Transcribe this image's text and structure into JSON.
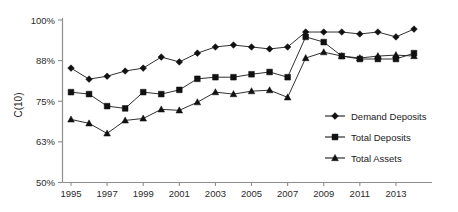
{
  "chart_data": {
    "type": "line",
    "title": "",
    "xlabel": "",
    "ylabel": "C(10)",
    "ylim": [
      50,
      100
    ],
    "xlim": [
      1995,
      2014
    ],
    "grid": false,
    "legend_position": "right-inside",
    "ytick_labels": [
      "100%",
      "88%",
      "75%",
      "63%",
      "50%"
    ],
    "ytick_values": [
      100,
      87.5,
      75,
      62.5,
      50
    ],
    "xtick_labels": [
      "1995",
      "1997",
      "1999",
      "2001",
      "2003",
      "2005",
      "2007",
      "2009",
      "2011",
      "2013"
    ],
    "xtick_values": [
      1995,
      1997,
      1999,
      2001,
      2003,
      2005,
      2007,
      2009,
      2011,
      2013
    ],
    "x": [
      1995,
      1996,
      1997,
      1998,
      1999,
      2000,
      2001,
      2002,
      2003,
      2004,
      2005,
      2006,
      2007,
      2008,
      2009,
      2010,
      2011,
      2012,
      2013,
      2014
    ],
    "series": [
      {
        "name": "Demand Deposits",
        "marker": "diamond",
        "values": [
          85.2,
          81.8,
          82.7,
          84.3,
          85.2,
          88.6,
          87.1,
          89.8,
          91.7,
          92.3,
          91.7,
          91.1,
          91.7,
          96.3,
          96.3,
          96.3,
          95.7,
          96.3,
          94.8,
          97.2
        ]
      },
      {
        "name": "Total Deposits",
        "marker": "square",
        "values": [
          77.8,
          77.2,
          73.5,
          72.8,
          77.8,
          77.2,
          78.5,
          81.9,
          82.4,
          82.4,
          83.3,
          84.0,
          82.4,
          94.8,
          93.2,
          88.9,
          88.0,
          88.0,
          88.0,
          89.8
        ]
      },
      {
        "name": "Total Assets",
        "marker": "triangle",
        "values": [
          69.4,
          68.2,
          65.1,
          69.1,
          69.7,
          72.5,
          72.2,
          74.7,
          77.8,
          77.2,
          78.1,
          78.4,
          76.2,
          88.3,
          90.1,
          88.9,
          88.3,
          88.9,
          89.2,
          88.9
        ]
      }
    ]
  }
}
